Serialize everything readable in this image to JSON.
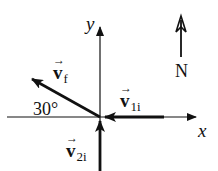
{
  "diagram": {
    "type": "vector-diagram",
    "axes": {
      "x_label": "x",
      "y_label": "y"
    },
    "vectors": [
      {
        "name": "v_f",
        "symbol": "v",
        "subscript": "f",
        "direction": "30° above -x axis (up-left)"
      },
      {
        "name": "v_1i",
        "symbol": "v",
        "subscript": "1i",
        "direction": "-x (pointing toward origin from right)"
      },
      {
        "name": "v_2i",
        "symbol": "v",
        "subscript": "2i",
        "direction": "+y (pointing toward origin from below)"
      }
    ],
    "labels": {
      "vf_symbol": "v",
      "vf_sub": "f",
      "v1i_symbol": "v",
      "v1i_sub": "1i",
      "v2i_symbol": "v",
      "v2i_sub": "2i",
      "vec_arrow": "→",
      "angle": "30°",
      "north": "N"
    },
    "colors": {
      "ink": "#111111",
      "background": "#ffffff"
    }
  }
}
